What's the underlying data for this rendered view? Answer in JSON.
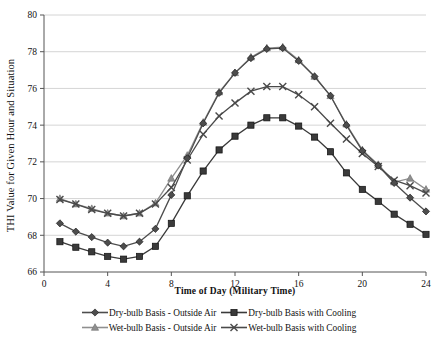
{
  "chart_data": {
    "type": "line",
    "title": "",
    "xlabel": "Time of Day  (Military  Time)",
    "ylabel": "THI Value for Given Hour and Situation",
    "xlim": [
      0,
      24
    ],
    "ylim": [
      66,
      80
    ],
    "xticks": [
      0,
      4,
      8,
      12,
      16,
      20,
      24
    ],
    "yticks": [
      66,
      68,
      70,
      72,
      74,
      76,
      78,
      80
    ],
    "grid": "horizontal",
    "legend_position": "bottom",
    "x": [
      1,
      2,
      3,
      4,
      5,
      6,
      7,
      8,
      9,
      10,
      11,
      12,
      13,
      14,
      15,
      16,
      17,
      18,
      19,
      20,
      21,
      22,
      23,
      24
    ],
    "series": [
      {
        "name": "Dry-bulb Basis - Outside Air",
        "marker": "diamond",
        "color": "#4d4d4d",
        "values": [
          68.65,
          68.2,
          67.9,
          67.6,
          67.4,
          67.65,
          68.35,
          70.2,
          72.2,
          74.1,
          75.75,
          76.85,
          77.65,
          78.15,
          78.2,
          77.5,
          76.65,
          75.6,
          74.0,
          72.6,
          71.8,
          70.85,
          70.05,
          69.3
        ]
      },
      {
        "name": "Dry-bulb Basis with Cooling",
        "marker": "square",
        "color": "#3a3a3a",
        "values": [
          67.65,
          67.35,
          67.1,
          66.85,
          66.7,
          66.85,
          67.4,
          68.65,
          70.15,
          71.5,
          72.65,
          73.4,
          74.0,
          74.4,
          74.4,
          73.95,
          73.35,
          72.55,
          71.4,
          70.5,
          69.85,
          69.15,
          68.6,
          68.05
        ]
      },
      {
        "name": "Wet-bulb Basis - Outside Air",
        "marker": "triangle",
        "color": "#8f8f8f",
        "values": [
          70.0,
          69.7,
          69.45,
          69.2,
          69.05,
          69.2,
          69.75,
          71.1,
          72.35,
          74.15,
          75.8,
          76.85,
          77.7,
          78.2,
          78.25,
          77.55,
          76.65,
          75.6,
          74.05,
          72.65,
          71.85,
          70.9,
          71.1,
          70.5
        ]
      },
      {
        "name": "Wet-bulb Basis with Cooling",
        "marker": "cross",
        "color": "#4a4a4a",
        "values": [
          69.95,
          69.7,
          69.4,
          69.2,
          69.05,
          69.2,
          69.7,
          70.6,
          72.1,
          73.5,
          74.5,
          75.2,
          75.85,
          76.1,
          76.1,
          75.65,
          75.0,
          74.1,
          73.25,
          72.45,
          71.75,
          71.0,
          70.7,
          70.3
        ]
      }
    ]
  },
  "axes": {
    "y_tick_labels": [
      "66",
      "68",
      "70",
      "72",
      "74",
      "76",
      "78",
      "80"
    ],
    "x_tick_labels": [
      "0",
      "4",
      "8",
      "12",
      "16",
      "20",
      "24"
    ]
  },
  "legend": {
    "rows": [
      [
        {
          "label": "Dry-bulb Basis - Outside Air",
          "marker": "diamond",
          "color": "#4d4d4d"
        },
        {
          "label": "Dry-bulb Basis with Cooling",
          "marker": "square",
          "color": "#3a3a3a"
        }
      ],
      [
        {
          "label": "Wet-bulb Basis - Outside Air",
          "marker": "triangle",
          "color": "#8f8f8f"
        },
        {
          "label": "Wet-bulb Basis with Cooling",
          "marker": "cross",
          "color": "#4a4a4a"
        }
      ]
    ]
  }
}
